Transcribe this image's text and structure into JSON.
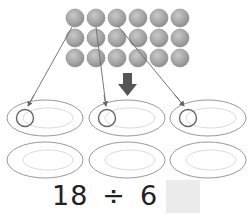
{
  "problem": {
    "dividend": "18",
    "operator": "÷",
    "divisor": "6",
    "equals": "=",
    "answer": ""
  },
  "objects": {
    "type": "balls",
    "rows": 3,
    "columns": 6,
    "count": 18,
    "color": "#9a9a9a"
  },
  "plates": {
    "count": 6,
    "rows": 2,
    "columns": 3
  },
  "arrows": {
    "guide_lines": 3,
    "down_arrow_color": "#555555"
  },
  "colors": {
    "ball_fill": "#a8a8a8",
    "ball_stroke": "#8a8a8a",
    "plate_outer": "#8c8c8c",
    "plate_inner": "#d6d6d6",
    "marker_circle": "#666666",
    "answer_box": "#ececec"
  }
}
